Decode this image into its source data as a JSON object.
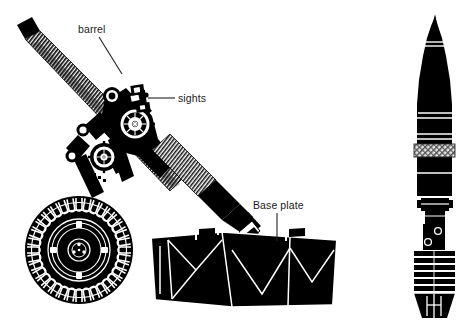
{
  "figure": {
    "background_color": "#ffffff",
    "ink_color": "#000000",
    "width": 470,
    "height": 325
  },
  "labels": [
    {
      "id": "barrel",
      "text": "barrel",
      "x": 78,
      "y": 33,
      "leader": {
        "type": "line",
        "x1": 99,
        "y1": 37,
        "x2": 122,
        "y2": 74
      }
    },
    {
      "id": "sights",
      "text": "sights",
      "x": 178,
      "y": 102,
      "leader": {
        "type": "line",
        "x1": 175,
        "y1": 98,
        "x2": 148,
        "y2": 98
      }
    },
    {
      "id": "base-plate",
      "text": "Base plate",
      "x": 253,
      "y": 209,
      "leader": {
        "type": "line",
        "x1": 277,
        "y1": 213,
        "x2": 277,
        "y2": 241
      }
    }
  ],
  "parts": {
    "mortar": {
      "name": "mortar-assembly",
      "components": [
        "barrel",
        "muzzle-cap",
        "cooling-fins",
        "elevation-gear",
        "traverse-gear",
        "sight-unit",
        "bipod-legs",
        "road-wheel",
        "breech",
        "base-plate"
      ]
    },
    "bomb": {
      "name": "mortar-bomb",
      "components": [
        "nose-fuze",
        "ogive",
        "body-bands",
        "driving-band",
        "body",
        "boom-joint",
        "tail-boom",
        "gas-vent-holes",
        "propellant-increments",
        "fin-assembly"
      ]
    }
  },
  "colors": {
    "ink": "#000000",
    "paper": "#ffffff",
    "mid_gray": "#6e6e6e",
    "light_gray": "#b9b9b9"
  }
}
